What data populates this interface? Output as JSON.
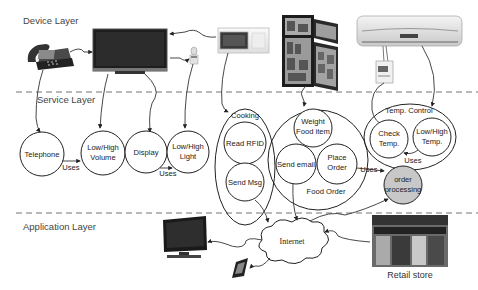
{
  "layers": {
    "device": "Device Layer",
    "service": "Service Layer",
    "application": "Application Layer"
  },
  "devices": [
    "telephone",
    "tv-monitor",
    "light-bulb",
    "microwave",
    "refrigerator",
    "air-conditioner",
    "thermostat-sensor"
  ],
  "services": {
    "telephone": "Telephone",
    "low_high_volume": [
      "Low/High",
      "Volume"
    ],
    "display": "Display",
    "low_high_light": [
      "Low/High",
      "Light"
    ],
    "cooking": {
      "title": "Cooking",
      "read_rfid": "Read RFID",
      "send_msg": "Send Msg"
    },
    "food_order": {
      "title": "Food Order",
      "weight_food_item": [
        "Weight",
        "Food item"
      ],
      "send_email": "Send email",
      "place_order": [
        "Place",
        "Order"
      ]
    },
    "temp_control": {
      "title": "Temp. Control",
      "check_temp": [
        "Check",
        "Temp."
      ],
      "low_high_temp": [
        "Low/High",
        "Temp."
      ]
    },
    "order_processing": [
      "order",
      "processing"
    ],
    "uses": "Uses"
  },
  "application": {
    "internet": "Internet",
    "retail_store": "Retail store"
  },
  "colors": {
    "order_processing_fill": "#c8c8c8",
    "dash": "#777777"
  }
}
